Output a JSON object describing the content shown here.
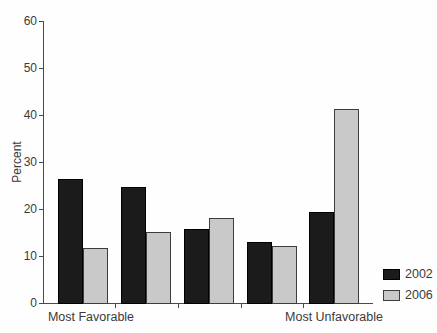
{
  "chart_data": {
    "type": "bar",
    "title": "",
    "ylabel": "Percent",
    "xlabel": "",
    "ylim": [
      0,
      60
    ],
    "yticks": [
      0,
      10,
      20,
      30,
      40,
      50,
      60
    ],
    "categories": [
      "Most Favorable",
      "",
      "",
      "",
      "Most Unfavorable"
    ],
    "series": [
      {
        "name": "2002",
        "color": "#1b1b1b",
        "border": "#000000",
        "values": [
          26.4,
          24.6,
          15.7,
          12.9,
          19.3
        ]
      },
      {
        "name": "2006",
        "color": "#c9c9c9",
        "border": "#3d3d3d",
        "values": [
          11.8,
          15.2,
          18.1,
          12.1,
          41.2
        ]
      }
    ],
    "grid": false,
    "legend_position": "right"
  },
  "colors": {
    "axis": "#4a4a4a",
    "text": "#3b3b3b",
    "background": "#fefefe"
  }
}
